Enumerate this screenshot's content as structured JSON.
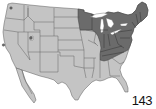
{
  "figure": {
    "number": "143",
    "type": "range map",
    "region": "United States and northern Mexico (Baja California)",
    "colors": {
      "background": "#ffffff",
      "out_of_range": "#c4c4c4",
      "in_range": "#6b6b6b",
      "borders": "#5a5a5a"
    },
    "legend": {
      "in_range_description": "Shaded (dark) area: species range",
      "states_in_range": [
        "Minnesota",
        "Wisconsin",
        "Michigan",
        "Illinois (east edge)",
        "Indiana",
        "Ohio",
        "Kentucky",
        "Tennessee (north)",
        "West Virginia",
        "Virginia",
        "Pennsylvania",
        "New York",
        "New Jersey",
        "Maryland",
        "Delaware",
        "Connecticut",
        "Rhode Island",
        "Massachusetts",
        "Vermont",
        "New Hampshire",
        "Maine",
        "North Carolina (north)"
      ],
      "isolated_spots": [
        "Seattle area, Washington",
        "Salt Lake area, Utah",
        "San Francisco Bay area, California"
      ]
    }
  }
}
